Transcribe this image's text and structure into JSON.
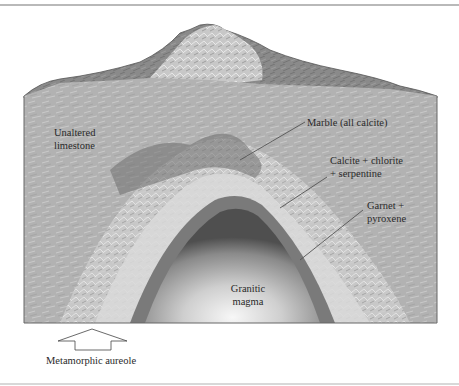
{
  "figure": {
    "labels": {
      "unaltered_line1": "Unaltered",
      "unaltered_line2": "limestone",
      "marble": "Marble (all calcite)",
      "calcite_line1": "Calcite + chlorite",
      "calcite_line2": "+ serpentine",
      "garnet_line1": "Garnet +",
      "garnet_line2": "pyroxene",
      "granitic_line1": "Granitic",
      "granitic_line2": "magma",
      "aureole": "Metamorphic aureole"
    },
    "colors": {
      "limestone": "#b4b4b4",
      "mountain": "#8a8a8a",
      "magma_center": "#f0f0f0",
      "magma_edge": "#5a5a5a",
      "leader_line": "#555555",
      "rule": "#b9b9b9"
    }
  }
}
